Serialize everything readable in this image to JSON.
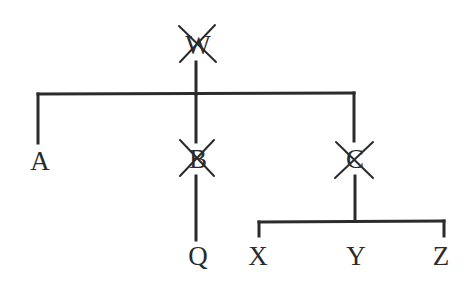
{
  "diagram": {
    "type": "tree",
    "line_color": "#2b2b2b",
    "nodes": {
      "W": {
        "label": "W",
        "crossed_out": true
      },
      "A": {
        "label": "A",
        "crossed_out": false
      },
      "B": {
        "label": "B",
        "crossed_out": true
      },
      "C": {
        "label": "C",
        "crossed_out": true
      },
      "Q": {
        "label": "Q",
        "crossed_out": false
      },
      "X": {
        "label": "X",
        "crossed_out": false
      },
      "Y": {
        "label": "Y",
        "crossed_out": false
      },
      "Z": {
        "label": "Z",
        "crossed_out": false
      }
    },
    "edges": [
      [
        "W",
        "A"
      ],
      [
        "W",
        "B"
      ],
      [
        "W",
        "C"
      ],
      [
        "B",
        "Q"
      ],
      [
        "C",
        "X"
      ],
      [
        "C",
        "Y"
      ],
      [
        "C",
        "Z"
      ]
    ]
  }
}
